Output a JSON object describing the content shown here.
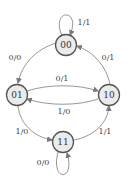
{
  "diagram": {
    "type": "state-machine",
    "nodes": [
      {
        "id": "00",
        "label": "00"
      },
      {
        "id": "01",
        "label": "01"
      },
      {
        "id": "10",
        "label": "10"
      },
      {
        "id": "11",
        "label": "11"
      }
    ],
    "edges": [
      {
        "from": "00",
        "to": "00",
        "label": "1/1"
      },
      {
        "from": "00",
        "to": "01",
        "label": "0/0"
      },
      {
        "from": "10",
        "to": "00",
        "label": "0/1"
      },
      {
        "from": "01",
        "to": "10",
        "label": "0/1"
      },
      {
        "from": "10",
        "to": "01",
        "label": "1/0"
      },
      {
        "from": "01",
        "to": "11",
        "label": "1/0"
      },
      {
        "from": "11",
        "to": "10",
        "label": "1/1"
      },
      {
        "from": "11",
        "to": "11",
        "label": "0/0"
      }
    ]
  },
  "colors": {
    "node_fill": "#ebebeb",
    "node_stroke": "#555555",
    "edge": "#8a8a8a"
  }
}
